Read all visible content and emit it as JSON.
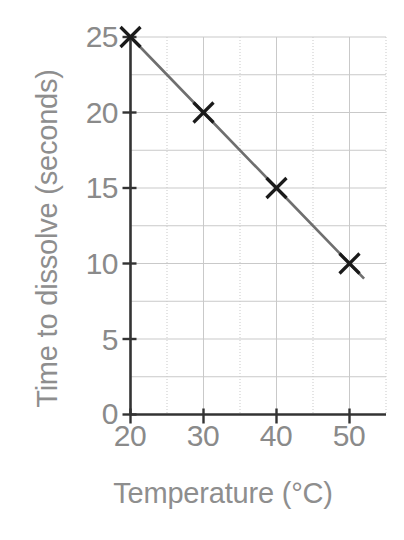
{
  "chart_data": {
    "type": "line",
    "title": "",
    "xlabel": "Temperature (°C)",
    "ylabel": "Time to dissolve (seconds)",
    "x": [
      20,
      30,
      40,
      50
    ],
    "values": [
      25,
      20,
      15,
      10
    ],
    "series": [
      {
        "name": "Time to dissolve",
        "x": [
          20,
          30,
          40,
          50
        ],
        "values": [
          25,
          20,
          15,
          10
        ],
        "marker": "x",
        "line_color": "#6f6f6f",
        "marker_color": "#1a1a1a"
      }
    ],
    "xlim": [
      20,
      55
    ],
    "ylim": [
      0,
      25
    ],
    "xticks": [
      20,
      30,
      40,
      50
    ],
    "yticks": [
      0,
      5,
      10,
      15,
      20,
      25
    ],
    "xtick_labels": [
      "20",
      "30",
      "40",
      "50"
    ],
    "ytick_labels": [
      "0",
      "5",
      "10",
      "15",
      "20",
      "25"
    ],
    "x_minor_step": 5,
    "y_minor_step": 2.5,
    "grid": true,
    "grid_color": "#c9c9c9",
    "legend": "none",
    "axis_color": "#333333",
    "label_color": "#8a8a8a",
    "trendline": {
      "extends_past_last_point": true,
      "end_x": 52,
      "end_y": 9
    }
  },
  "axis_titles": {
    "y": "Time to dissolve (seconds)",
    "x": "Temperature (°C)"
  },
  "title_fragment": {
    "text": "▪"
  }
}
